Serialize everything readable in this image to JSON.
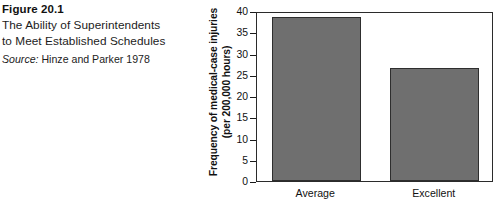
{
  "caption": {
    "number": "Figure 20.1",
    "title_line1": "The Ability of Superintendents",
    "title_line2": "to Meet Established Schedules",
    "source_label": "Source:",
    "source_text": "Hinze and Parker 1978"
  },
  "chart_data": {
    "type": "bar",
    "title": "",
    "categories": [
      "Average",
      "Excellent"
    ],
    "values": [
      38.5,
      26.5
    ],
    "xlabel": "",
    "ylabel_line1": "Frequency of medical-case injuries",
    "ylabel_line2": "(per 200,000 hours)",
    "ylim": [
      0,
      40
    ],
    "ytick_values": [
      0,
      5,
      10,
      15,
      20,
      25,
      30,
      35,
      40
    ],
    "ytick_labels": [
      "0",
      "5",
      "10",
      "15",
      "20",
      "25",
      "30",
      "35",
      "40"
    ],
    "grid": false,
    "legend": false,
    "bar_color": "#6f6f6f",
    "bar_edge_color": "#2e2e2e",
    "frame_color": "#2b2b2b"
  }
}
